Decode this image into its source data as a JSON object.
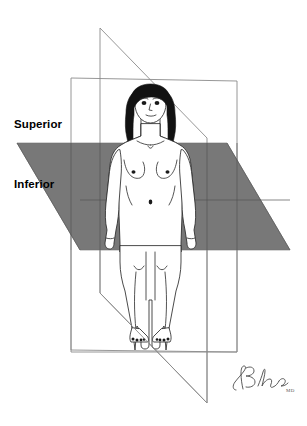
{
  "figure": {
    "background_color": "#ffffff"
  },
  "labels": {
    "superior": "Superior",
    "inferior": "Inferior"
  },
  "signature": {
    "suffix": "MD"
  },
  "planes": [
    {
      "id": "frontal-plane",
      "name": "frontal-coronal-plane",
      "shape": "rectangle",
      "fill": "none",
      "stroke": "#8b8b8b",
      "points": "71,78 237,81 237,352 71,350"
    },
    {
      "id": "sagittal-plane",
      "name": "sagittal-plane",
      "shape": "parallelogram",
      "fill": "none",
      "stroke": "#8b8b8b",
      "points": "100,28 207,138 207,403 100,293"
    },
    {
      "id": "transverse-plane",
      "name": "transverse-plane",
      "shape": "parallelogram",
      "fill": "#787878",
      "stroke": "#6e6e6e",
      "points": "17,143 227,143 290,250 80,250"
    }
  ],
  "colors": {
    "plane_gray": "#787878",
    "outline_gray": "#8b8b8b",
    "ink": "#2a2a2a",
    "hair": "#121212",
    "signature_ink": "#4a4a4a"
  }
}
